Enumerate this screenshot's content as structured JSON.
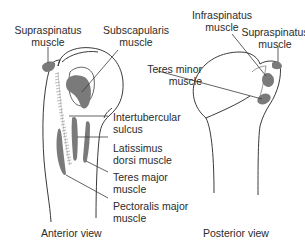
{
  "diagram": {
    "colors": {
      "bone_outline": "#3a3a3a",
      "muscle_fill": "#7a7a7a",
      "leader_line": "#3a3a3a",
      "background": "#ffffff"
    },
    "views": [
      {
        "id": "anterior",
        "caption": "Anterior view",
        "labels": [
          {
            "line1": "Supraspinatus",
            "line2": "muscle"
          },
          {
            "line1": "Subscapularis",
            "line2": "muscle"
          },
          {
            "line1": "Intertubercular",
            "line2": "sulcus"
          },
          {
            "line1": "Latissimus",
            "line2": "dorsi muscle"
          },
          {
            "line1": "Teres major",
            "line2": "muscle"
          },
          {
            "line1": "Pectoralis major",
            "line2": "muscle"
          }
        ]
      },
      {
        "id": "posterior",
        "caption": "Posterior view",
        "labels": [
          {
            "line1": "Infraspinatus",
            "line2": "muscle"
          },
          {
            "line1": "Supraspinatus",
            "line2": "muscle"
          },
          {
            "line1": "Teres minor",
            "line2": "muscle"
          }
        ]
      }
    ]
  }
}
